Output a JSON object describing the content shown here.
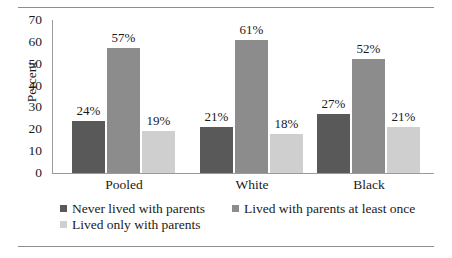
{
  "chart_data": {
    "type": "bar",
    "title": "",
    "xlabel": "",
    "ylabel": "Percent",
    "ylim": [
      0,
      70
    ],
    "yticks": [
      0,
      10,
      20,
      30,
      40,
      50,
      60,
      70
    ],
    "grid": false,
    "legend_position": "bottom",
    "categories": [
      "Pooled",
      "White",
      "Black"
    ],
    "series": [
      {
        "name": "Never lived with parents",
        "color": "#595959",
        "values": [
          24,
          21,
          27
        ],
        "labels": [
          "24%",
          "21%",
          "27%"
        ]
      },
      {
        "name": "Lived with parents at least once",
        "color": "#8c8c8c",
        "values": [
          57,
          61,
          52
        ],
        "labels": [
          "57%",
          "61%",
          "52%"
        ]
      },
      {
        "name": "Lived only with parents",
        "color": "#cfcfcf",
        "values": [
          19,
          18,
          21
        ],
        "labels": [
          "19%",
          "18%",
          "21%"
        ]
      }
    ]
  },
  "axis": {
    "y_title": "Percent",
    "y_tick_labels": [
      "70",
      "60",
      "50",
      "40",
      "30",
      "20",
      "10",
      "0"
    ],
    "x_tick_labels": [
      "Pooled",
      "White",
      "Black"
    ]
  },
  "legend": {
    "row1": [
      {
        "label": "Never lived with parents",
        "series": 0
      },
      {
        "label": "Lived with parents at least once",
        "series": 1
      }
    ],
    "row2": [
      {
        "label": "Lived only with parents",
        "series": 2
      }
    ]
  }
}
